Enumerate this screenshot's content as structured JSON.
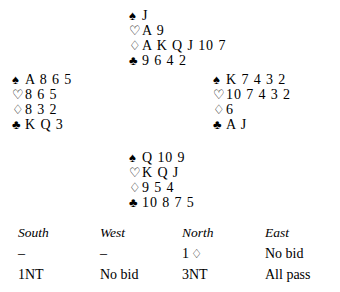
{
  "suits": {
    "spade": "♠",
    "heart": "♡",
    "diamond": "♢",
    "club": "♣"
  },
  "hands": {
    "north": {
      "label": "North hand",
      "rows": [
        {
          "suit": "♠",
          "suit_name": "spade",
          "ranks": "J"
        },
        {
          "suit": "♡",
          "suit_name": "heart",
          "ranks": "A 9"
        },
        {
          "suit": "♢",
          "suit_name": "diamond",
          "ranks": "A K Q J 10 7"
        },
        {
          "suit": "♣",
          "suit_name": "club",
          "ranks": "9 6 4 2"
        }
      ]
    },
    "west": {
      "label": "West hand",
      "rows": [
        {
          "suit": "♠",
          "suit_name": "spade",
          "ranks": "A 8 6 5"
        },
        {
          "suit": "♡",
          "suit_name": "heart",
          "ranks": "8 6 5"
        },
        {
          "suit": "♢",
          "suit_name": "diamond",
          "ranks": "8 3 2"
        },
        {
          "suit": "♣",
          "suit_name": "club",
          "ranks": "K Q 3"
        }
      ]
    },
    "east": {
      "label": "East hand",
      "rows": [
        {
          "suit": "♠",
          "suit_name": "spade",
          "ranks": "K 7 4 3 2"
        },
        {
          "suit": "♡",
          "suit_name": "heart",
          "ranks": "10 7 4 3 2"
        },
        {
          "suit": "♢",
          "suit_name": "diamond",
          "ranks": "6"
        },
        {
          "suit": "♣",
          "suit_name": "club",
          "ranks": "A J"
        }
      ]
    },
    "south": {
      "label": "South hand",
      "rows": [
        {
          "suit": "♠",
          "suit_name": "spade",
          "ranks": "Q 10 9"
        },
        {
          "suit": "♡",
          "suit_name": "heart",
          "ranks": "K Q J"
        },
        {
          "suit": "♢",
          "suit_name": "diamond",
          "ranks": "9 5 4"
        },
        {
          "suit": "♣",
          "suit_name": "club",
          "ranks": "10 8 7 5"
        }
      ]
    }
  },
  "bidding": {
    "headers": {
      "south": "South",
      "west": "West",
      "north": "North",
      "east": "East"
    },
    "rows": [
      {
        "south": "–",
        "west": "–",
        "north_level": "1",
        "north_suit": "♢",
        "east": "No bid"
      },
      {
        "south": "1NT",
        "west": "No bid",
        "north_level": "3NT",
        "north_suit": "",
        "east": "All pass"
      }
    ]
  }
}
